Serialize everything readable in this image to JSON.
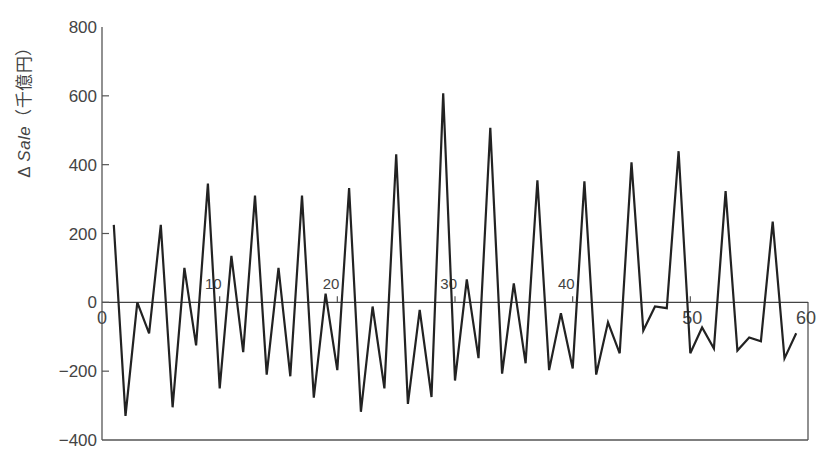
{
  "chart_data": {
    "type": "line",
    "title": "",
    "xlabel": "",
    "ylabel": "Δ Sale（千億円）",
    "ylabel_parts": {
      "prefix": "Δ ",
      "italic": "Sale",
      "suffix": "（千億円）"
    },
    "xlim": [
      0,
      60
    ],
    "ylim": [
      -400,
      800
    ],
    "x_ticks": [
      0,
      10,
      20,
      30,
      40,
      50,
      60
    ],
    "y_ticks": [
      -400,
      -200,
      0,
      200,
      400,
      600,
      800
    ],
    "y_tick_labels": [
      "−400",
      "−200",
      "0",
      "200",
      "400",
      "600",
      "800"
    ],
    "grid": false,
    "legend": null,
    "line_color": "#222222",
    "series": [
      {
        "name": "Δ Sale",
        "x": [
          1,
          2,
          3,
          4,
          5,
          6,
          7,
          8,
          9,
          10,
          11,
          12,
          13,
          14,
          15,
          16,
          17,
          18,
          19,
          20,
          21,
          22,
          23,
          24,
          25,
          26,
          27,
          28,
          29,
          30,
          31,
          32,
          33,
          34,
          35,
          36,
          37,
          38,
          39,
          40,
          41,
          42,
          43,
          44,
          45,
          46,
          47,
          48,
          49,
          50,
          51,
          52,
          53,
          54,
          55,
          56,
          57,
          58,
          59
        ],
        "values": [
          225,
          -330,
          0,
          -90,
          225,
          -305,
          100,
          -125,
          345,
          -250,
          135,
          -145,
          310,
          -210,
          100,
          -215,
          310,
          -277,
          25,
          -197,
          332,
          -318,
          -12,
          -250,
          430,
          -295,
          -22,
          -275,
          607,
          -227,
          67,
          -162,
          507,
          -207,
          55,
          -177,
          355,
          -197,
          -32,
          -192,
          352,
          -210,
          -58,
          -148,
          407,
          -82,
          -12,
          -17,
          439,
          -148,
          -73,
          -134,
          323,
          -140,
          -102,
          -113,
          235,
          -163,
          -90
        ]
      }
    ]
  }
}
